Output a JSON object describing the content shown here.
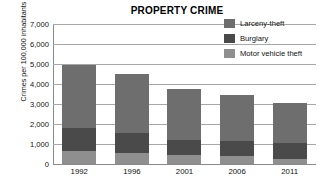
{
  "chart_data": {
    "type": "bar",
    "subtype": "stacked-column",
    "title": "PROPERTY CRIME",
    "xlabel": "",
    "ylabel": "Crimes per 100,000 inhabitants",
    "categories": [
      "1992",
      "1996",
      "2001",
      "2006",
      "2011"
    ],
    "ylim": [
      0,
      7000
    ],
    "ytick_labels": [
      "7,000",
      "6,000",
      "5,000",
      "4,000",
      "3,000",
      "2,000",
      "1,000",
      "0"
    ],
    "ytick_values": [
      7000,
      6000,
      5000,
      4000,
      3000,
      2000,
      1000,
      0
    ],
    "grid": true,
    "legend_position": "top-right",
    "series": [
      {
        "name": "Larceny-theft",
        "color": "#6e6e6e",
        "values": [
          3150,
          2970,
          2540,
          2320,
          2040
        ]
      },
      {
        "name": "Burglary",
        "color": "#4a4a4a",
        "values": [
          1170,
          1000,
          760,
          730,
          800
        ]
      },
      {
        "name": "Motor vehicle theft",
        "color": "#8f8f8f",
        "values": [
          630,
          530,
          430,
          400,
          230
        ]
      }
    ],
    "stack_order_bottom_to_top": [
      "Motor vehicle theft",
      "Burglary",
      "Larceny-theft"
    ],
    "totals": [
      4950,
      4500,
      3730,
      3450,
      3070
    ]
  },
  "colors": {
    "larceny": "#6e6e6e",
    "burglary": "#4a4a4a",
    "motor_vehicle": "#8f8f8f",
    "gridline": "#a8a8a8",
    "text": "#111111",
    "background": "#ffffff"
  }
}
